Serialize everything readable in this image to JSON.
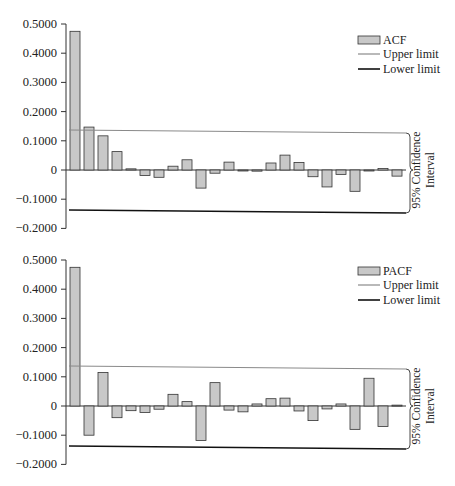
{
  "chart_data": [
    {
      "type": "bar",
      "title": "",
      "xlabel": "",
      "ylabel": "",
      "ylim": [
        -0.2,
        0.5
      ],
      "yticks": [
        "0.5000",
        "0.4000",
        "0.3000",
        "0.2000",
        "0.1000",
        "0",
        "-0.1000",
        "-0.2000"
      ],
      "grid": false,
      "legend_position": "top-right",
      "legend": [
        "ACF",
        "Upper limit",
        "Lower limit"
      ],
      "categories": [
        1,
        2,
        3,
        4,
        5,
        6,
        7,
        8,
        9,
        10,
        11,
        12,
        13,
        14,
        15,
        16,
        17,
        18,
        19,
        20,
        21,
        22,
        23,
        24
      ],
      "series": [
        {
          "name": "ACF",
          "values": [
            0.475,
            0.147,
            0.117,
            0.063,
            0.004,
            -0.019,
            -0.025,
            0.013,
            0.035,
            -0.062,
            -0.011,
            0.027,
            -0.002,
            -0.004,
            0.024,
            0.051,
            0.026,
            -0.023,
            -0.058,
            -0.015,
            -0.073,
            -0.001,
            0.005,
            -0.021
          ]
        },
        {
          "name": "Upper limit",
          "value": 0.137
        },
        {
          "name": "Lower limit",
          "value": -0.137
        }
      ],
      "annotation": "95% Confidence Interval"
    },
    {
      "type": "bar",
      "title": "",
      "xlabel": "",
      "ylabel": "",
      "ylim": [
        -0.2,
        0.5
      ],
      "yticks": [
        "0.5000",
        "0.4000",
        "0.3000",
        "0.2000",
        "0.1000",
        "0",
        "-0.1000",
        "-0.2000"
      ],
      "grid": false,
      "legend_position": "top-right",
      "legend": [
        "PACF",
        "Upper limit",
        "Lower limit"
      ],
      "categories": [
        1,
        2,
        3,
        4,
        5,
        6,
        7,
        8,
        9,
        10,
        11,
        12,
        13,
        14,
        15,
        16,
        17,
        18,
        19,
        20,
        21,
        22,
        23,
        24
      ],
      "series": [
        {
          "name": "PACF",
          "values": [
            0.475,
            -0.1,
            0.115,
            -0.04,
            -0.016,
            -0.022,
            -0.011,
            0.04,
            0.015,
            -0.118,
            0.08,
            -0.014,
            -0.02,
            0.007,
            0.025,
            0.027,
            -0.017,
            -0.05,
            -0.01,
            0.007,
            -0.08,
            0.095,
            -0.07,
            0.003
          ]
        },
        {
          "name": "Upper limit",
          "value": 0.137
        },
        {
          "name": "Lower limit",
          "value": -0.137
        }
      ],
      "annotation": "95% Confidence Interval"
    }
  ],
  "charts": {
    "acf": {
      "legend": {
        "bars": "ACF",
        "upper": "Upper limit",
        "lower": "Lower limit"
      },
      "ci_label_line1": "95% Confidence",
      "ci_label_line2": "Interval"
    },
    "pacf": {
      "legend": {
        "bars": "PACF",
        "upper": "Upper limit",
        "lower": "Lower limit"
      },
      "ci_label_line1": "95% Confidence",
      "ci_label_line2": "Interval"
    }
  },
  "colors": {
    "bar_fill": "#c8c8c8",
    "bar_stroke": "#333333",
    "upper_limit": "#8a8a8a",
    "lower_limit": "#111111",
    "axis": "#333333"
  }
}
